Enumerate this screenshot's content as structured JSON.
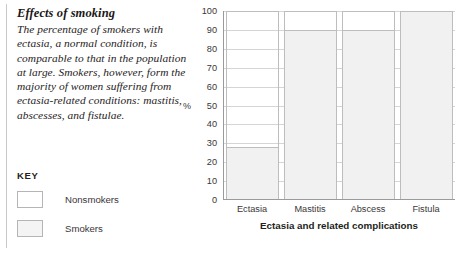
{
  "sidebar": {
    "title": "Effects of smoking",
    "body": "The percentage of smokers with ectasia, a normal condition, is comparable to that in the population at large. Smokers, however, form the majority of women suffering from ectasia-related conditions: mastitis, abscesses, and fistulae.",
    "key_title": "KEY",
    "legend": [
      {
        "label": "Nonsmokers",
        "color": "#ffffff"
      },
      {
        "label": "Smokers",
        "color": "#f4f4f4"
      }
    ]
  },
  "chart_data": {
    "type": "bar",
    "title": "",
    "xlabel": "Ectasia and related complications",
    "ylabel": "%",
    "categories": [
      "Ectasia",
      "Mastitis",
      "Abscess",
      "Fistula"
    ],
    "values": [
      28,
      90,
      90,
      100
    ],
    "series": [
      {
        "name": "Smokers",
        "values": [
          28,
          90,
          90,
          100
        ]
      }
    ],
    "ylim": [
      0,
      100
    ],
    "yticks": [
      0,
      10,
      20,
      30,
      40,
      50,
      60,
      70,
      80,
      90,
      100
    ],
    "ytick_labels": [
      "0",
      "10",
      "20",
      "30",
      "40",
      "50",
      "60",
      "70",
      "80",
      "90",
      "100"
    ],
    "grid": true,
    "legend_position": "left-panel",
    "bar_fill": "#f1f1f1",
    "bar_stroke": "#bdbdbd",
    "gridline_color": "#d5d5d5",
    "axis_color": "#9a9a9a"
  }
}
